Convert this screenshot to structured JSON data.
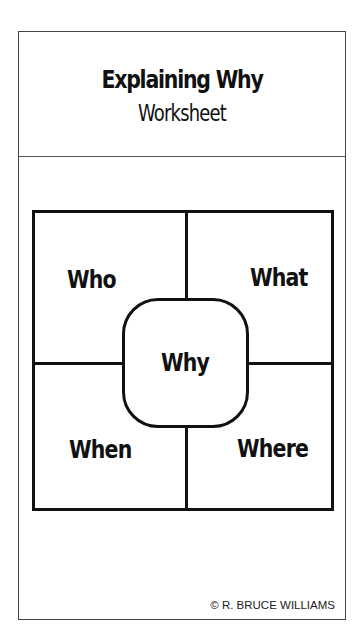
{
  "header": {
    "title": "Explaining Why",
    "subtitle": "Worksheet"
  },
  "diagram": {
    "center_label": "Why",
    "quadrants": {
      "top_left": "Who",
      "top_right": "What",
      "bottom_left": "When",
      "bottom_right": "Where"
    }
  },
  "footer": {
    "copyright": "© R. BRUCE WILLIAMS"
  }
}
